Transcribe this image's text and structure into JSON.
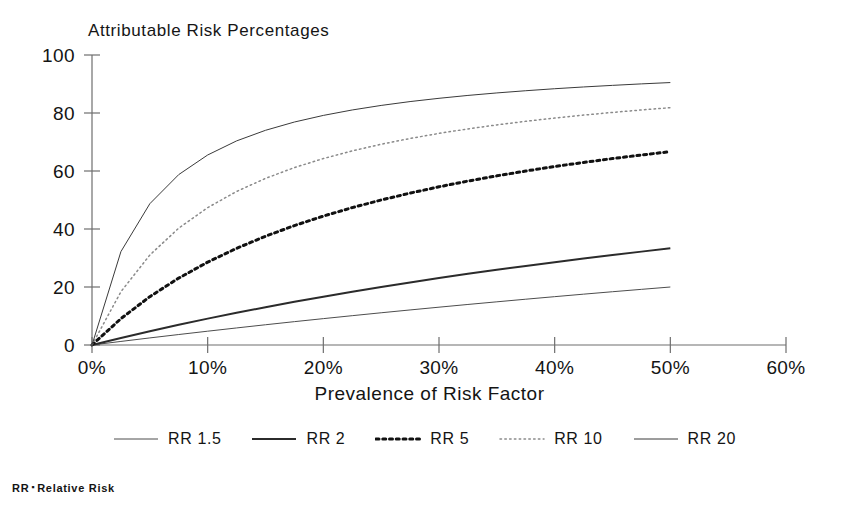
{
  "chart_data": {
    "type": "line",
    "title": "Attributable Risk Percentages",
    "xlabel": "Prevalence of Risk Factor",
    "ylabel": "",
    "xlim": [
      0,
      60
    ],
    "ylim": [
      0,
      100
    ],
    "grid": false,
    "legend_position": "bottom",
    "x_ticks": [
      "0%",
      "10%",
      "20%",
      "30%",
      "40%",
      "50%",
      "60%"
    ],
    "x_tick_values": [
      0,
      10,
      20,
      30,
      40,
      50,
      60
    ],
    "y_ticks": [
      "0",
      "20",
      "40",
      "60",
      "80",
      "100"
    ],
    "y_tick_values": [
      0,
      20,
      40,
      60,
      80,
      100
    ],
    "x": [
      0,
      2.5,
      5,
      7.5,
      10,
      12.5,
      15,
      17.5,
      20,
      22.5,
      25,
      27.5,
      30,
      32.5,
      35,
      37.5,
      40,
      42.5,
      45,
      47.5,
      50
    ],
    "series": [
      {
        "name": "RR 1.5",
        "relative_risk": 1.5,
        "style": "solid-thin",
        "color": "#4d4d4d",
        "width": 1,
        "values": [
          0.0,
          1.23,
          2.44,
          3.61,
          4.76,
          5.88,
          6.98,
          8.05,
          9.09,
          10.11,
          11.11,
          12.09,
          13.04,
          13.98,
          14.89,
          15.79,
          16.67,
          17.53,
          18.37,
          19.19,
          20.0
        ]
      },
      {
        "name": "RR 2",
        "relative_risk": 2,
        "style": "solid-bold",
        "color": "#2b2b2b",
        "width": 2,
        "values": [
          0.0,
          2.44,
          4.76,
          6.98,
          9.09,
          11.11,
          13.04,
          14.89,
          16.67,
          18.37,
          20.0,
          21.57,
          23.08,
          24.53,
          25.93,
          27.27,
          28.57,
          29.82,
          31.03,
          32.2,
          33.33
        ]
      },
      {
        "name": "RR 5",
        "relative_risk": 5,
        "style": "dotted-bold",
        "color": "#111111",
        "width": 3,
        "values": [
          0.0,
          9.09,
          16.67,
          23.08,
          28.57,
          33.33,
          37.5,
          41.18,
          44.44,
          47.37,
          50.0,
          52.38,
          54.55,
          56.52,
          58.33,
          60.0,
          61.54,
          62.96,
          64.29,
          65.52,
          66.67
        ]
      },
      {
        "name": "RR 10",
        "relative_risk": 10,
        "style": "dotted-fine",
        "color": "#8a8a8a",
        "width": 1.5,
        "values": [
          0.0,
          18.37,
          31.03,
          40.29,
          47.37,
          52.94,
          57.45,
          61.18,
          64.29,
          66.94,
          69.23,
          71.22,
          72.97,
          74.52,
          75.9,
          77.14,
          78.26,
          79.28,
          80.2,
          81.05,
          81.82
        ]
      },
      {
        "name": "RR 20",
        "relative_risk": 20,
        "style": "solid-thin",
        "color": "#3a3a3a",
        "width": 1,
        "values": [
          0.0,
          32.2,
          48.72,
          58.77,
          65.52,
          70.38,
          74.03,
          76.89,
          79.17,
          81.05,
          82.61,
          83.94,
          85.07,
          86.06,
          86.92,
          87.68,
          88.37,
          88.98,
          89.53,
          90.04,
          90.5
        ]
      }
    ],
    "formula_note": "AR% = P(RR-1) / (1 + P(RR-1)) x 100"
  },
  "legend": {
    "items": [
      {
        "label": "RR 1.5"
      },
      {
        "label": "RR 2"
      },
      {
        "label": "RR 5"
      },
      {
        "label": "RR 10"
      },
      {
        "label": "RR 20"
      }
    ]
  },
  "footnote": {
    "abbrev": "RR",
    "separator": "▪",
    "expansion": "Relative Risk"
  }
}
